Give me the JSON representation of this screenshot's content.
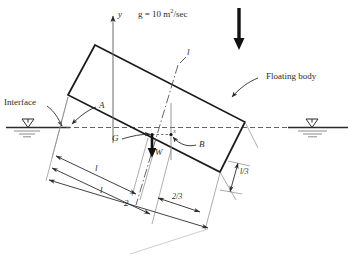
{
  "figure": {
    "type": "engineering-diagram",
    "background_color": "#ffffff",
    "line_color": "#2b2b2b",
    "accent_color": "#000000"
  },
  "annotations": {
    "gravity_label_prefix": "g = 10 m",
    "gravity_label_exponent": "2",
    "gravity_label_suffix": "/sec",
    "interface_label": "Interface",
    "floating_body_label": "Floating body",
    "axis_y_label": "y",
    "point_a_label": "A",
    "point_g_label": "G",
    "point_b_label": "B",
    "weight_label": "W",
    "centerline_label": "l",
    "small_axis_label": "x"
  },
  "dimensions": {
    "dim_upper": "l",
    "dim_middle": "l",
    "dim_lower": "2",
    "dim_two_thirds": "2/3",
    "dim_one_third": "l/3"
  },
  "water_symbols": {
    "left": "▽",
    "right": "▽"
  },
  "icon_names": {
    "gravity_arrow": "down-arrow-icon",
    "weight_arrow": "down-arrow-icon",
    "water_level_left": "water-level-icon",
    "water_level_right": "water-level-icon",
    "y_axis_arrow": "up-arrow-icon"
  }
}
